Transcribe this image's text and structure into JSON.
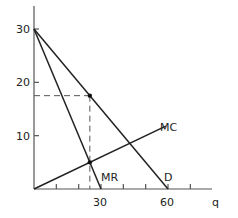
{
  "chart_data": {
    "type": "line",
    "title": "",
    "xlabel": "q",
    "ylabel": "",
    "xlim": [
      0,
      70
    ],
    "ylim": [
      0,
      35
    ],
    "x_ticks": [
      10,
      20,
      30,
      40,
      50,
      60,
      70
    ],
    "x_tick_labels": {
      "30": "30",
      "60": "60"
    },
    "y_ticks": [
      10,
      20,
      30
    ],
    "y_tick_labels": [
      "10",
      "20",
      "30"
    ],
    "grid": false,
    "series": [
      {
        "name": "D",
        "points": [
          [
            0,
            30
          ],
          [
            60,
            0
          ]
        ],
        "label": "D"
      },
      {
        "name": "MR",
        "points": [
          [
            0,
            30
          ],
          [
            30,
            0
          ]
        ],
        "label": "MR"
      },
      {
        "name": "MC",
        "points": [
          [
            0,
            0
          ],
          [
            59,
            11.8
          ]
        ],
        "label": "MC"
      }
    ],
    "annotations": {
      "equilibrium_point": [
        25,
        17.5
      ],
      "mr_mc_intersection": [
        25,
        5
      ],
      "dashed_horizontal_price": 17.5,
      "dashed_vertical_quantity": 25
    }
  },
  "labels": {
    "y30": "30",
    "y20": "20",
    "y10": "10",
    "x30": "30",
    "x60": "60",
    "xaxis": "q",
    "mc": "MC",
    "mr": "MR",
    "d": "D"
  }
}
